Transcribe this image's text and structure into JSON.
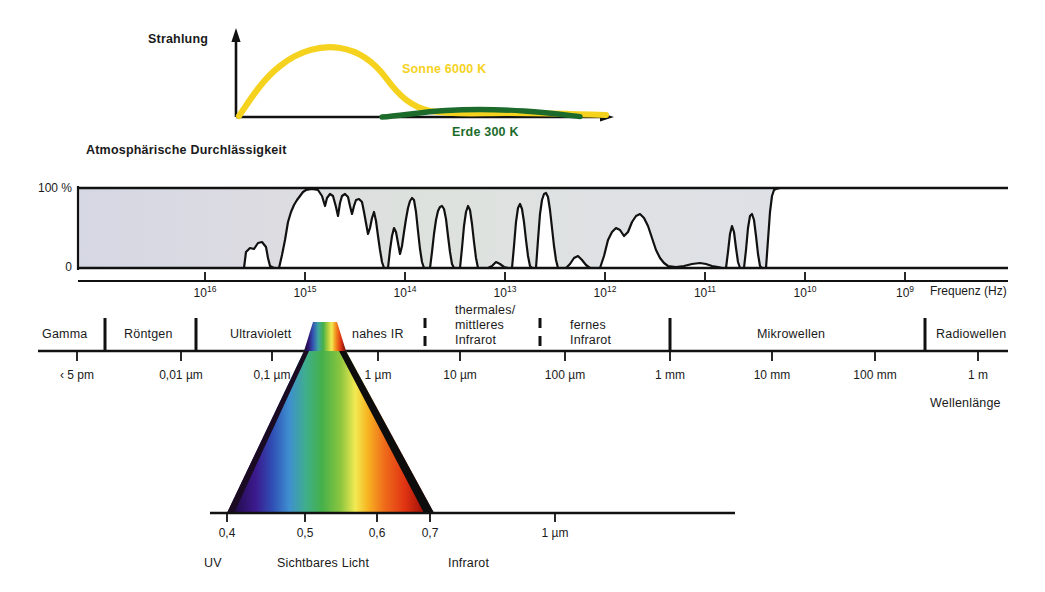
{
  "figure": {
    "title_top": "Strahlung",
    "title_mid": "Atmosphärische Durchlässigkeit",
    "axis_freq_label": "Frequenz (Hz)",
    "axis_wave_label": "Wellenlänge"
  },
  "radiation_chart": {
    "y_axis_label": "Strahlung",
    "curves": [
      {
        "name": "sun",
        "label": "Sonne 6000 K",
        "color": "#f5d21e",
        "temperature_k": 6000
      },
      {
        "name": "earth",
        "label": "Erde 300 K",
        "color": "#1d6b2b",
        "temperature_k": 300
      }
    ]
  },
  "transmission_chart": {
    "title": "Atmosphärische Durchlässigkeit",
    "y_ticks": [
      "100 %",
      "0"
    ],
    "y_range": [
      0,
      100
    ],
    "x_ticks": [
      {
        "base": "10",
        "exp": "16"
      },
      {
        "base": "10",
        "exp": "15"
      },
      {
        "base": "10",
        "exp": "14"
      },
      {
        "base": "10",
        "exp": "13"
      },
      {
        "base": "10",
        "exp": "12"
      },
      {
        "base": "10",
        "exp": "11"
      },
      {
        "base": "10",
        "exp": "10"
      },
      {
        "base": "10",
        "exp": "9"
      }
    ],
    "x_axis_title": "Frequenz (Hz)"
  },
  "spectrum_bands": [
    {
      "name": "Gamma",
      "divider_after": true
    },
    {
      "name": "Röntgen",
      "divider_after": true
    },
    {
      "name": "Ultraviolett",
      "divider_after": false
    },
    {
      "name": "nahes IR",
      "divider_after": false
    },
    {
      "name": "thermales/ mittleres Infrarot",
      "line1": "thermales/",
      "line2": "mittleres",
      "line3": "Infrarot"
    },
    {
      "name": "fernes Infrarot",
      "line1": "fernes",
      "line2": "Infrarot"
    },
    {
      "name": "Mikrowellen"
    },
    {
      "name": "Radiowellen"
    }
  ],
  "wavelength_axis": {
    "title": "Wellenlänge",
    "ticks": [
      "‹ 5 pm",
      "0,01 µm",
      "0,1 µm",
      "1 µm",
      "10 µm",
      "100 µm",
      "1 mm",
      "10 mm",
      "100 mm",
      "1 m"
    ]
  },
  "visible_axis": {
    "ticks": [
      "0,4",
      "0,5",
      "0,6",
      "0,7",
      "1 µm"
    ],
    "regions": [
      "UV",
      "Sichtbares Licht",
      "Infrarot"
    ]
  },
  "colors": {
    "sun": "#f5d21e",
    "earth": "#1d6b2b",
    "ink": "#111111",
    "band_tint": "#d8dce4"
  }
}
